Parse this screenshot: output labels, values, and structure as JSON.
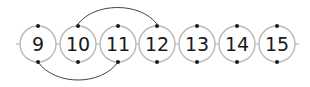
{
  "diagram": {
    "colors": {
      "circle_stroke": "#b8b8b8",
      "line": "#b8b8b8",
      "arc": "#444444",
      "dot": "#1a1a1a",
      "text": "#1a1a1a"
    },
    "numbers": [
      {
        "label": "9",
        "cx": 38
      },
      {
        "label": "10",
        "cx": 78
      },
      {
        "label": "11",
        "cx": 118
      },
      {
        "label": "12",
        "cx": 157
      },
      {
        "label": "13",
        "cx": 197
      },
      {
        "label": "14",
        "cx": 237
      },
      {
        "label": "15",
        "cx": 277
      }
    ],
    "arcs": [
      {
        "name": "jump-10-to-12",
        "from": "10",
        "to": "12",
        "side": "top"
      },
      {
        "name": "jump-9-to-11",
        "from": "9",
        "to": "11",
        "side": "bottom"
      }
    ]
  }
}
